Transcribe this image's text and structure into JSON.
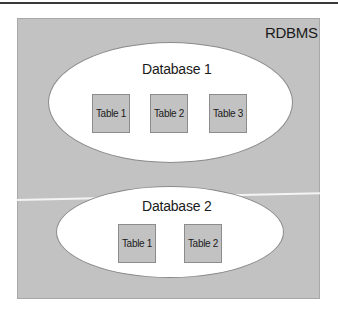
{
  "rdbms": {
    "label": "RDBMS"
  },
  "databases": [
    {
      "label": "Database 1",
      "tables": [
        "Table 1",
        "Table 2",
        "Table 3"
      ]
    },
    {
      "label": "Database 2",
      "tables": [
        "Table 1",
        "Table 2"
      ]
    }
  ],
  "colors": {
    "container_fill": "#c2c2c2",
    "database_fill": "#ffffff",
    "table_fill": "#c2c2c2",
    "rule_line": "#3a3a3a"
  }
}
